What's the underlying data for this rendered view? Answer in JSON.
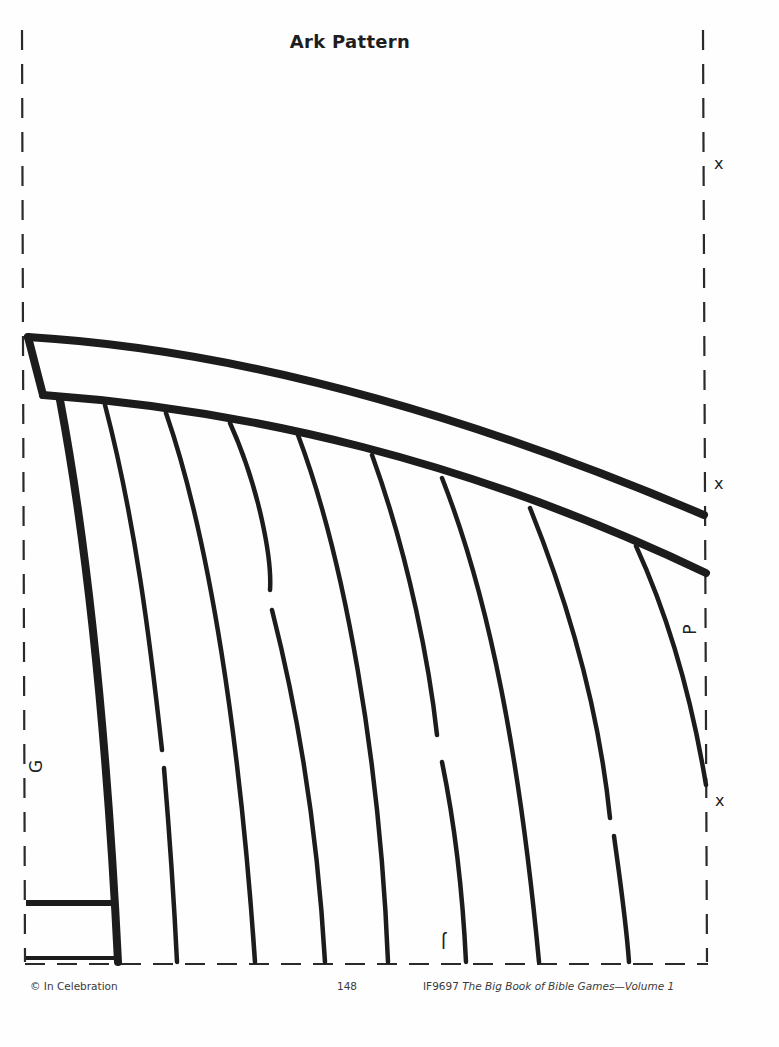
{
  "page": {
    "title": "Ark Pattern",
    "colors": {
      "ink": "#1c1c1c",
      "paper": "#fefefe"
    }
  },
  "markers": {
    "cut_marks": [
      "x",
      "x",
      "x"
    ],
    "piece_labels": {
      "left": "G",
      "right": "P",
      "bottom": "J"
    }
  },
  "footer": {
    "copyright": "© In Celebration",
    "page_number": "148",
    "book_code": "IF9697",
    "book_title": "The Big Book of Bible Games—Volume 1"
  }
}
